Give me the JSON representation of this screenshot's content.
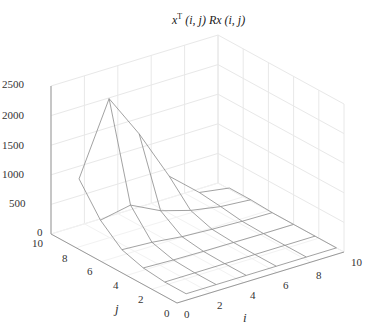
{
  "chart_data": {
    "type": "surface3d",
    "title_parts": {
      "base1": "x",
      "sup": "T",
      "rest": " (i, j) Rx (i, j)"
    },
    "xlabel": "i",
    "ylabel": "j",
    "zlabel": "",
    "xlim": [
      0,
      10
    ],
    "ylim": [
      0,
      10
    ],
    "zlim": [
      0,
      2500
    ],
    "x_ticks": [
      0,
      2,
      4,
      6,
      8,
      10
    ],
    "y_ticks": [
      0,
      2,
      4,
      6,
      8,
      10
    ],
    "z_ticks": [
      0,
      500,
      1000,
      1500,
      2000,
      2500
    ],
    "grid": true,
    "grid_i": [
      1,
      2.8,
      4.6,
      6.4,
      8.2,
      10
    ],
    "grid_j": [
      0.6,
      2.3,
      4.0,
      5.7,
      7.4,
      9.1
    ],
    "z": [
      [
        0,
        0,
        0,
        0,
        0,
        0
      ],
      [
        0,
        0,
        0,
        0,
        0,
        0
      ],
      [
        40,
        20,
        10,
        5,
        0,
        0
      ],
      [
        150,
        120,
        60,
        30,
        10,
        0
      ],
      [
        450,
        550,
        300,
        150,
        60,
        20
      ],
      [
        950,
        2150,
        1400,
        530,
        100,
        20
      ]
    ]
  },
  "colors": {
    "mesh": "#8a8a8a",
    "axis": "#999999",
    "grid": "#e8e8e8",
    "text": "#333333"
  }
}
